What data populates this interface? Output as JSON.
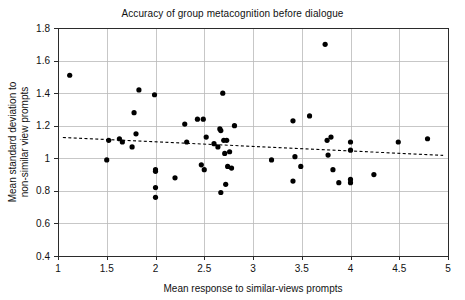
{
  "chart_data": {
    "type": "scatter",
    "title": "Accuracy of group metacognition before dialogue",
    "xlabel": "Mean response to similar-views prompts",
    "ylabel": "Mean standard deviation to non-similar view prompts",
    "ylabel_line1": "Mean standard deviation to",
    "ylabel_line2": "non-similar view prompts",
    "xlim": [
      1,
      5
    ],
    "ylim": [
      0.4,
      1.8
    ],
    "xticks": [
      1,
      1.5,
      2,
      2.5,
      3,
      3.5,
      4,
      4.5,
      5
    ],
    "xtick_labels": [
      "1",
      "1.5",
      "2",
      "2.5",
      "3",
      "3.5",
      "4",
      "4.5",
      "5"
    ],
    "yticks": [
      0.4,
      0.6,
      0.8,
      1.0,
      1.2,
      1.4,
      1.6,
      1.8
    ],
    "ytick_labels": [
      "0.4",
      "0.6",
      "0.8",
      "1",
      "1.2",
      "1.4",
      "1.6",
      "1.8"
    ],
    "grid": true,
    "legend": "none",
    "marker": "filled-circle",
    "marker_color": "#000000",
    "grid_color": "#b9b9b9",
    "axis_color": "#2b2b2b",
    "points": [
      [
        1.12,
        1.51
      ],
      [
        1.5,
        0.99
      ],
      [
        1.52,
        1.11
      ],
      [
        1.63,
        1.12
      ],
      [
        1.66,
        1.1
      ],
      [
        1.76,
        1.07
      ],
      [
        1.78,
        1.28
      ],
      [
        1.8,
        1.15
      ],
      [
        1.83,
        1.42
      ],
      [
        1.99,
        1.39
      ],
      [
        2.0,
        0.93
      ],
      [
        2.0,
        0.92
      ],
      [
        2.0,
        0.82
      ],
      [
        2.0,
        0.76
      ],
      [
        2.2,
        0.88
      ],
      [
        2.3,
        1.21
      ],
      [
        2.32,
        1.1
      ],
      [
        2.43,
        1.24
      ],
      [
        2.47,
        0.96
      ],
      [
        2.49,
        1.24
      ],
      [
        2.5,
        0.93
      ],
      [
        2.52,
        1.13
      ],
      [
        2.6,
        1.09
      ],
      [
        2.64,
        1.07
      ],
      [
        2.66,
        1.18
      ],
      [
        2.67,
        1.17
      ],
      [
        2.67,
        0.79
      ],
      [
        2.69,
        1.4
      ],
      [
        2.7,
        1.11
      ],
      [
        2.71,
        1.03
      ],
      [
        2.72,
        0.84
      ],
      [
        2.73,
        1.11
      ],
      [
        2.74,
        0.95
      ],
      [
        2.76,
        1.04
      ],
      [
        2.78,
        0.94
      ],
      [
        2.81,
        1.2
      ],
      [
        3.19,
        0.99
      ],
      [
        3.41,
        1.23
      ],
      [
        3.41,
        0.86
      ],
      [
        3.43,
        1.01
      ],
      [
        3.49,
        0.95
      ],
      [
        3.58,
        1.26
      ],
      [
        3.74,
        1.7
      ],
      [
        3.76,
        1.11
      ],
      [
        3.77,
        1.02
      ],
      [
        3.8,
        1.13
      ],
      [
        3.82,
        0.93
      ],
      [
        3.88,
        0.85
      ],
      [
        4.0,
        1.1
      ],
      [
        4.0,
        1.05
      ],
      [
        4.0,
        0.87
      ],
      [
        4.0,
        0.85
      ],
      [
        4.24,
        0.9
      ],
      [
        4.49,
        1.1
      ],
      [
        4.79,
        1.12
      ]
    ],
    "trend_line": {
      "style": "dashed",
      "x": [
        1.05,
        4.95
      ],
      "y": [
        1.128,
        1.018
      ]
    }
  }
}
